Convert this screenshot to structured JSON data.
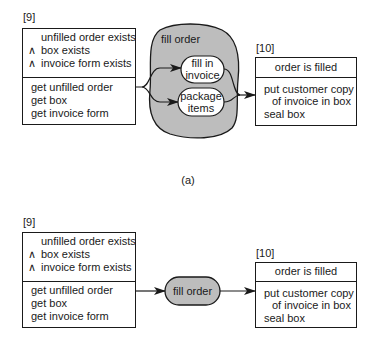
{
  "diagram": {
    "caption_a": "(a)",
    "top": {
      "left_box": {
        "id_label": "[9]",
        "preconditions": [
          "unfilled order exists",
          "box exists",
          "invoice form exists"
        ],
        "and_symbol": "∧",
        "actions": [
          "get unfilled order",
          "get box",
          "get invoice form"
        ]
      },
      "process": {
        "label": "fill order",
        "subprocesses": [
          {
            "line1": "fill in",
            "line2": "invoice"
          },
          {
            "line1": "package",
            "line2": "items"
          }
        ]
      },
      "right_box": {
        "id_label": "[10]",
        "postcondition": "order is filled",
        "actions": [
          "put customer copy",
          "of invoice in box",
          "seal box"
        ]
      }
    },
    "bottom": {
      "left_box": {
        "id_label": "[9]",
        "preconditions": [
          "unfilled order exists",
          "box exists",
          "invoice form exists"
        ],
        "and_symbol": "∧",
        "actions": [
          "get unfilled order",
          "get box",
          "get invoice form"
        ]
      },
      "process": {
        "label": "fill order"
      },
      "right_box": {
        "id_label": "[10]",
        "postcondition": "order is filled",
        "actions": [
          "put customer copy",
          "of invoice in box",
          "seal box"
        ]
      }
    },
    "colors": {
      "fill_gray": "#bdbdbd",
      "stroke": "#1a1a1a",
      "background": "#ffffff"
    }
  }
}
